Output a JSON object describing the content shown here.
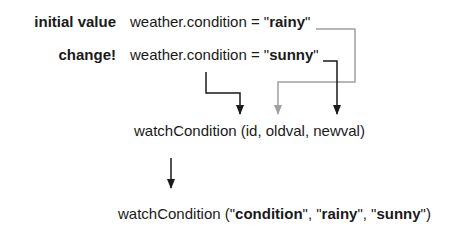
{
  "rows": {
    "initial": {
      "label": "initial value",
      "prefix": "weather.condition = \"",
      "value": "rainy",
      "suffix": "\""
    },
    "change": {
      "label": "change!",
      "prefix": "weather.condition = \"",
      "value": "sunny",
      "suffix": "\""
    }
  },
  "signature": "watchCondition (id, oldval, newval)",
  "call": {
    "func": "watchCondition (\"",
    "arg1": "condition",
    "sep1": "\", \"",
    "arg2": "rainy",
    "sep2": "\", \"",
    "arg3": "sunny",
    "end": "\")"
  },
  "colors": {
    "black_arrow": "#1a1a1a",
    "gray_arrow": "#a0a0a0"
  }
}
